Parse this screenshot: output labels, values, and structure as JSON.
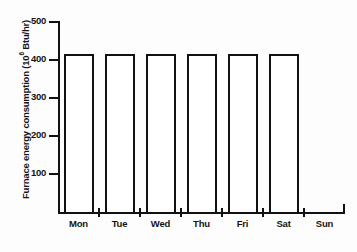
{
  "chart_data": {
    "type": "bar",
    "title": "",
    "subtitle": "",
    "xlabel": "",
    "ylabel": "Furnace energy consumption (10⁶ Btu/hr)",
    "ylabel_text": "Furnace energy consumption (10",
    "ylabel_exponent": "6",
    "ylabel_tail": " Btu/hr)",
    "categories": [
      "Mon",
      "Tue",
      "Wed",
      "Thu",
      "Fri",
      "Sat",
      "Sun"
    ],
    "values": [
      415,
      415,
      415,
      415,
      415,
      415,
      0
    ],
    "ylim": [
      0,
      500
    ],
    "yticks": [
      100,
      200,
      300,
      400,
      500
    ],
    "ytick_labels": [
      "100",
      "200",
      "300",
      "400",
      "500"
    ],
    "grid": false,
    "legend": false,
    "legend_position": "none",
    "bar_fill_color": "#ffffff",
    "bar_edge_color": "#111111",
    "axis_color": "#111111",
    "background_color": "#ffffff"
  }
}
